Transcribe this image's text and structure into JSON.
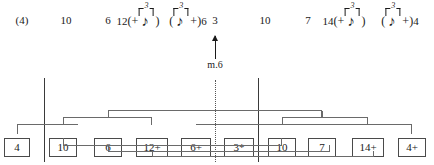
{
  "diagram": {
    "type": "music-analysis-reduction-graph",
    "annotation": {
      "arrow_label": "m.6",
      "arrow_direction": "up",
      "arrow_x": 215,
      "arrow_icon": "up-arrow-icon"
    },
    "top_row": {
      "name": "interval-series",
      "items": [
        {
          "id": "t0",
          "text": "(4)",
          "x": 22,
          "kind": "plain"
        },
        {
          "id": "t1",
          "text": "10",
          "x": 66,
          "kind": "plain"
        },
        {
          "id": "t2",
          "text": "6",
          "x": 108,
          "kind": "plain"
        },
        {
          "id": "t3",
          "text": "12",
          "x": 138,
          "kind": "figure-left",
          "figure": {
            "open": "(+",
            "close": ")",
            "triplet": "3",
            "note": "eighth-note"
          }
        },
        {
          "id": "t4",
          "text": "6",
          "x": 188,
          "kind": "figure-right",
          "figure": {
            "open": "(",
            "close": "+)",
            "triplet": "3",
            "note": "eighth-note"
          }
        },
        {
          "id": "t5",
          "text": "3",
          "x": 215,
          "kind": "plain"
        },
        {
          "id": "t6",
          "text": "10",
          "x": 265,
          "kind": "plain"
        },
        {
          "id": "t7",
          "text": "7",
          "x": 308,
          "kind": "plain"
        },
        {
          "id": "t8",
          "text": "14",
          "x": 344,
          "kind": "figure-left",
          "figure": {
            "open": "(+",
            "close": ")",
            "triplet": "3",
            "note": "eighth-note"
          }
        },
        {
          "id": "t9",
          "text": "4",
          "x": 400,
          "kind": "figure-right",
          "figure": {
            "open": "(",
            "close": "+)",
            "triplet": "3",
            "note": "eighth-note"
          }
        }
      ]
    },
    "barlines": [
      {
        "id": "b-left",
        "name": "barline-solid-left",
        "x": 44,
        "y": 78,
        "height": 84,
        "style": "solid"
      },
      {
        "id": "b-dotted",
        "name": "barline-dotted-middle",
        "x": 215,
        "y": 80,
        "height": 82,
        "style": "dotted"
      },
      {
        "id": "b-right",
        "name": "barline-solid-right",
        "x": 258,
        "y": 78,
        "height": 84,
        "style": "solid"
      }
    ],
    "boxes": [
      {
        "id": "x0",
        "label": "4",
        "x": 17,
        "w": 26
      },
      {
        "id": "x1",
        "label": "10",
        "x": 63,
        "w": 28
      },
      {
        "id": "x2",
        "label": "6",
        "x": 108,
        "w": 28
      },
      {
        "id": "x3",
        "label": "12+",
        "x": 152,
        "w": 32
      },
      {
        "id": "x4",
        "label": "6+",
        "x": 196,
        "w": 30
      },
      {
        "id": "x5",
        "label": "3*",
        "x": 239,
        "w": 30
      },
      {
        "id": "x6",
        "label": "10",
        "x": 282,
        "w": 28
      },
      {
        "id": "x7",
        "label": "7",
        "x": 322,
        "w": 28
      },
      {
        "id": "x8",
        "label": "14+",
        "x": 368,
        "w": 32
      },
      {
        "id": "x9",
        "label": "4+",
        "x": 412,
        "w": 28
      }
    ],
    "upper_brackets": [
      {
        "id": "u1",
        "name": "bracket-4-to-head",
        "left": 17,
        "right": 78,
        "top": 124,
        "drop_left": 10,
        "drop_right": 0,
        "stem": null
      },
      {
        "id": "u2",
        "name": "bracket-10-12",
        "left": 63,
        "right": 152,
        "top": 117,
        "drop_left": 8,
        "drop_right": 8,
        "stem": 108
      },
      {
        "id": "u3",
        "name": "bracket-span-upper",
        "left": 108,
        "right": 322,
        "top": 110,
        "drop_left": 7,
        "drop_right": 7,
        "stem": null
      },
      {
        "id": "u4",
        "name": "bracket-10-14",
        "left": 282,
        "right": 368,
        "top": 117,
        "drop_left": 8,
        "drop_right": 8,
        "stem": 322
      },
      {
        "id": "u5",
        "name": "bracket-tail-4plus",
        "left": 196,
        "right": 412,
        "top": 124,
        "drop_left": 0,
        "drop_right": 10,
        "stem": null
      }
    ],
    "lower_brackets": [
      {
        "id": "l1",
        "name": "lower-bracket-inner",
        "left": 63,
        "right": 282,
        "top": 145,
        "rise_left": 7,
        "rise_right": 7
      },
      {
        "id": "l2",
        "name": "lower-bracket-middle",
        "left": 108,
        "right": 330,
        "top": 151,
        "rise_left": 6,
        "rise_right": 6
      },
      {
        "id": "l3",
        "name": "lower-bracket-outer",
        "left": 152,
        "right": 374,
        "top": 156,
        "rise_left": 5,
        "rise_right": 5
      }
    ],
    "colors": {
      "ink": "#1a1a1a",
      "rule": "#6a6a6a",
      "box_border": "#4a4a4a",
      "background": "#ffffff"
    }
  }
}
